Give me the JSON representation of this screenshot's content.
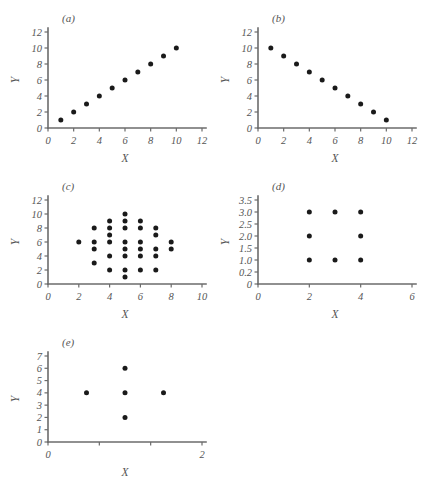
{
  "figure": {
    "background": "#ffffff",
    "dot_color": "#1a1a1a",
    "axis_color": "#6b6b6b",
    "text_color": "#555555"
  },
  "chart_data": [
    {
      "type": "scatter",
      "panel": "(a)",
      "title": "",
      "xlabel": "X",
      "ylabel": "Y",
      "xlim": [
        0,
        12
      ],
      "ylim": [
        0,
        12
      ],
      "xticks": [
        0,
        2,
        4,
        6,
        8,
        10,
        12
      ],
      "yticks": [
        0,
        2,
        4,
        6,
        8,
        10,
        12
      ],
      "xticklabels": [
        "0",
        "2",
        "4",
        "6",
        "8",
        "10",
        "12"
      ],
      "yticklabels": [
        "0",
        "2",
        "4",
        "6",
        "8",
        "10",
        "12"
      ],
      "grid": false,
      "legend": null,
      "description": "perfect positive linear relationship",
      "points": [
        {
          "x": 1,
          "y": 1
        },
        {
          "x": 2,
          "y": 2
        },
        {
          "x": 3,
          "y": 3
        },
        {
          "x": 4,
          "y": 4
        },
        {
          "x": 5,
          "y": 5
        },
        {
          "x": 6,
          "y": 6
        },
        {
          "x": 7,
          "y": 7
        },
        {
          "x": 8,
          "y": 8
        },
        {
          "x": 9,
          "y": 9
        },
        {
          "x": 10,
          "y": 10
        }
      ]
    },
    {
      "type": "scatter",
      "panel": "(b)",
      "title": "",
      "xlabel": "X",
      "ylabel": "Y",
      "xlim": [
        0,
        12
      ],
      "ylim": [
        0,
        12
      ],
      "xticks": [
        0,
        2,
        4,
        6,
        8,
        10,
        12
      ],
      "yticks": [
        0,
        2,
        4,
        6,
        8,
        10,
        12
      ],
      "xticklabels": [
        "0",
        "2",
        "4",
        "6",
        "8",
        "10",
        "12"
      ],
      "yticklabels": [
        "0",
        "2",
        "4",
        "6",
        "8",
        "10",
        "12"
      ],
      "grid": false,
      "legend": null,
      "description": "perfect negative linear relationship",
      "points": [
        {
          "x": 1,
          "y": 10
        },
        {
          "x": 2,
          "y": 9
        },
        {
          "x": 3,
          "y": 8
        },
        {
          "x": 4,
          "y": 7
        },
        {
          "x": 5,
          "y": 6
        },
        {
          "x": 6,
          "y": 5
        },
        {
          "x": 7,
          "y": 4
        },
        {
          "x": 8,
          "y": 3
        },
        {
          "x": 9,
          "y": 2
        },
        {
          "x": 10,
          "y": 1
        }
      ]
    },
    {
      "type": "scatter",
      "panel": "(c)",
      "title": "",
      "xlabel": "X",
      "ylabel": "Y",
      "xlim": [
        0,
        10
      ],
      "ylim": [
        0,
        12
      ],
      "xticks": [
        0,
        2,
        4,
        6,
        8,
        10
      ],
      "yticks": [
        0,
        2,
        4,
        6,
        8,
        10,
        12
      ],
      "xticklabels": [
        "0",
        "2",
        "4",
        "6",
        "8",
        "10"
      ],
      "yticklabels": [
        "0",
        "2",
        "4",
        "6",
        "8",
        "10",
        "12"
      ],
      "grid": false,
      "legend": null,
      "description": "diamond shaped cloud, no correlation",
      "points": [
        {
          "x": 2,
          "y": 6
        },
        {
          "x": 3,
          "y": 8
        },
        {
          "x": 3,
          "y": 6
        },
        {
          "x": 3,
          "y": 5
        },
        {
          "x": 3,
          "y": 3
        },
        {
          "x": 4,
          "y": 9
        },
        {
          "x": 4,
          "y": 8
        },
        {
          "x": 4,
          "y": 7
        },
        {
          "x": 4,
          "y": 6
        },
        {
          "x": 4,
          "y": 4
        },
        {
          "x": 4,
          "y": 2
        },
        {
          "x": 5,
          "y": 10
        },
        {
          "x": 5,
          "y": 9
        },
        {
          "x": 5,
          "y": 8
        },
        {
          "x": 5,
          "y": 6
        },
        {
          "x": 5,
          "y": 5
        },
        {
          "x": 5,
          "y": 4
        },
        {
          "x": 5,
          "y": 2
        },
        {
          "x": 5,
          "y": 1
        },
        {
          "x": 6,
          "y": 9
        },
        {
          "x": 6,
          "y": 8
        },
        {
          "x": 6,
          "y": 6
        },
        {
          "x": 6,
          "y": 5
        },
        {
          "x": 6,
          "y": 4
        },
        {
          "x": 6,
          "y": 2
        },
        {
          "x": 7,
          "y": 8
        },
        {
          "x": 7,
          "y": 7
        },
        {
          "x": 7,
          "y": 5
        },
        {
          "x": 7,
          "y": 4
        },
        {
          "x": 7,
          "y": 2
        },
        {
          "x": 8,
          "y": 6
        },
        {
          "x": 8,
          "y": 5
        }
      ]
    },
    {
      "type": "scatter",
      "panel": "(d)",
      "title": "",
      "xlabel": "X",
      "ylabel": "Y",
      "xlim": [
        0,
        6
      ],
      "ylim": [
        0,
        3.5
      ],
      "xticks": [
        0,
        2,
        4,
        6
      ],
      "yticks": [
        0,
        0.5,
        1.0,
        1.5,
        2.0,
        2.5,
        3.0,
        3.5
      ],
      "xticklabels": [
        "0",
        "2",
        "4",
        "6"
      ],
      "yticklabels": [
        "0",
        "0.2",
        "1.0",
        "1.5",
        "2.0",
        "2.5",
        "3.0",
        "3.5"
      ],
      "grid": false,
      "legend": null,
      "description": "three by three grid with missing centre point",
      "points": [
        {
          "x": 2,
          "y": 3.0
        },
        {
          "x": 3,
          "y": 3.0
        },
        {
          "x": 4,
          "y": 3.0
        },
        {
          "x": 2,
          "y": 2.0
        },
        {
          "x": 4,
          "y": 2.0
        },
        {
          "x": 2,
          "y": 1.0
        },
        {
          "x": 3,
          "y": 1.0
        },
        {
          "x": 4,
          "y": 1.0
        }
      ]
    },
    {
      "type": "scatter",
      "panel": "(e)",
      "title": "",
      "xlabel": "X",
      "ylabel": "Y",
      "xlim": [
        0,
        2
      ],
      "ylim": [
        0,
        7
      ],
      "xticks": [
        0,
        0.6667,
        1.3333,
        2
      ],
      "yticks": [
        0,
        1,
        2,
        3,
        4,
        5,
        6,
        7
      ],
      "xticklabels": [
        "0",
        "",
        "",
        "2"
      ],
      "yticklabels": [
        "0",
        "1",
        "2",
        "3",
        "4",
        "5",
        "6",
        "7"
      ],
      "grid": false,
      "legend": null,
      "description": "cross or plus shaped arrangement of five points",
      "points": [
        {
          "x": 1.0,
          "y": 6
        },
        {
          "x": 0.5,
          "y": 4
        },
        {
          "x": 1.0,
          "y": 4
        },
        {
          "x": 1.5,
          "y": 4
        },
        {
          "x": 1.0,
          "y": 2
        }
      ]
    }
  ],
  "panels": [
    {
      "label": "(a)",
      "left": 8,
      "top": 8,
      "width": 206,
      "height": 160
    },
    {
      "label": "(b)",
      "left": 218,
      "top": 8,
      "width": 206,
      "height": 160
    },
    {
      "label": "(c)",
      "left": 8,
      "top": 176,
      "width": 206,
      "height": 148
    },
    {
      "label": "(d)",
      "left": 218,
      "top": 176,
      "width": 206,
      "height": 148
    },
    {
      "label": "(e)",
      "left": 8,
      "top": 332,
      "width": 206,
      "height": 150
    }
  ]
}
